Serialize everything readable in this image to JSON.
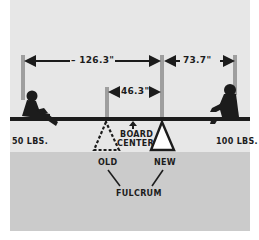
{
  "figure": {
    "type": "seesaw-fulcrum-diagram",
    "colors": {
      "upper_bg": "#e7e7e7",
      "ground_bg": "#cbcbcb",
      "ink": "#1c1c1c"
    },
    "dimensions": {
      "left_span": "– 126.3\"",
      "right_span": "73.7\"",
      "fulcrum_shift": "46.3\""
    },
    "weights": {
      "left_child": "50 LBS.",
      "right_child": "100 LBS."
    },
    "labels": {
      "board_center_line1": "BOARD",
      "board_center_line2": "CENTER",
      "old": "OLD",
      "new": "NEW",
      "fulcrum": "FULCRUM"
    }
  }
}
